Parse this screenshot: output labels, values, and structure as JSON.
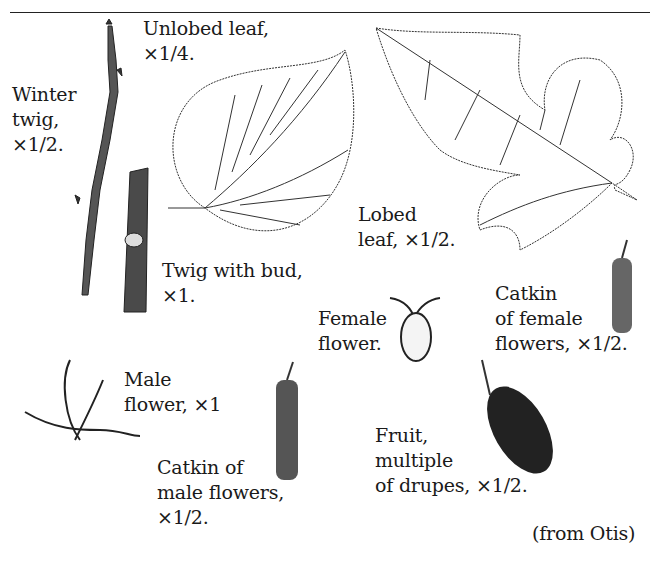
{
  "figure": {
    "labels": {
      "unlobed_leaf": "Unlobed leaf,\n×1/4.",
      "winter_twig": "Winter\ntwig,\n×1/2.",
      "lobed_leaf": "Lobed\nleaf, ×1/2.",
      "twig_with_bud": "Twig with bud,\n×1.",
      "female_flower": "Female\nflower.",
      "catkin_female": "Catkin\nof female\nflowers, ×1/2.",
      "male_flower": "Male\nflower, ×1",
      "catkin_male": "Catkin of\nmale flowers,\n×1/2.",
      "fruit": "Fruit,\nmultiple\nof drupes, ×1/2.",
      "credit": "(from Otis)"
    }
  }
}
